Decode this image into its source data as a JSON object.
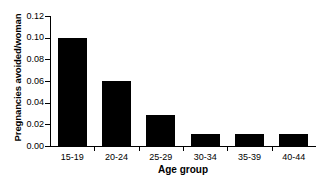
{
  "figure": {
    "background_color": "#ffffff",
    "axis_color": "#000000"
  },
  "chart_data": {
    "type": "bar",
    "title": "",
    "subtitle": "",
    "xlabel": "Age group",
    "ylabel": "Pregnancies avoided/woman",
    "categories": [
      "15-19",
      "20-24",
      "25-29",
      "30-34",
      "35-39",
      "40-44"
    ],
    "values": [
      0.1,
      0.06,
      0.029,
      0.011,
      0.011,
      0.011
    ],
    "series": [
      {
        "name": "Pregnancies avoided/woman",
        "values": [
          0.1,
          0.06,
          0.029,
          0.011,
          0.011,
          0.011
        ]
      }
    ],
    "ylim": [
      0.0,
      0.12
    ],
    "ytick_values": [
      0.0,
      0.02,
      0.04,
      0.06,
      0.08,
      0.1,
      0.12
    ],
    "ytick_labels": [
      "0.00",
      "0.02",
      "0.04",
      "0.06",
      "0.08",
      "0.10",
      "0.12"
    ],
    "xtick_labels": [
      "15-19",
      "20-24",
      "25-29",
      "30-34",
      "35-39",
      "40-44"
    ],
    "bar_color": "#000000",
    "grid": false,
    "legend": false,
    "legend_position": "none",
    "annotations": []
  },
  "caption": {
    "partial_text": ""
  }
}
